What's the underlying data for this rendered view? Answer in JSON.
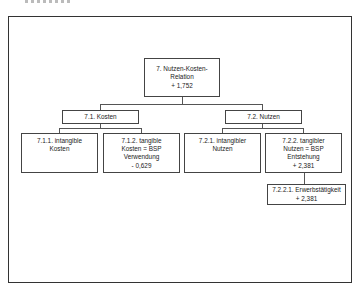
{
  "diagram": {
    "type": "tree",
    "root": {
      "id": "7",
      "lines": [
        "7. Nutzen-Kosten-",
        "Relation",
        "+ 1,752"
      ]
    },
    "level1": [
      {
        "id": "7.1",
        "lines": [
          "7.1. Kosten"
        ]
      },
      {
        "id": "7.2",
        "lines": [
          "7.2. Nutzen"
        ]
      }
    ],
    "level2": [
      {
        "id": "7.1.1",
        "parent": "7.1",
        "lines": [
          "7.1.1. intangible",
          "Kosten"
        ]
      },
      {
        "id": "7.1.2",
        "parent": "7.1",
        "lines": [
          "7.1.2. tangible",
          "Kosten = BSP",
          "Verwendung",
          "- 0,629"
        ]
      },
      {
        "id": "7.2.1",
        "parent": "7.2",
        "lines": [
          "7.2.1. intangibler",
          "Nutzen"
        ]
      },
      {
        "id": "7.2.2",
        "parent": "7.2",
        "lines": [
          "7.2.2. tangibler",
          "Nutzen = BSP",
          "Entstehung",
          "+ 2,381"
        ]
      }
    ],
    "level3": [
      {
        "id": "7.2.2.1",
        "parent": "7.2.2",
        "lines": [
          "7.2.2.1. Erwerbstätigkeit",
          "+ 2,381"
        ]
      }
    ]
  }
}
